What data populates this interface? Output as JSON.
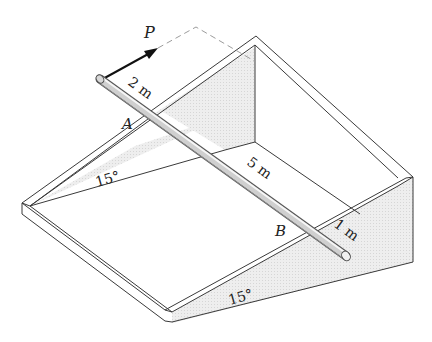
{
  "figure": {
    "type": "engineering statics diagram"
  },
  "labels": {
    "force": "P",
    "point_a": "A",
    "point_b": "B",
    "dim_rod_end_to_a": "2 m",
    "dim_box_length": "5 m",
    "dim_b_to_rod_end": "1 m",
    "angle_left": "15°",
    "angle_front": "15°"
  },
  "colors": {
    "line": "#3a3a3a",
    "shade": "#e9e9e9",
    "shade_dark": "#dcdcdc",
    "rod_light": "#f2f2f2",
    "rod_dark": "#9a9a9a",
    "dashed": "#9c9c9c",
    "arrow": "#111111"
  }
}
